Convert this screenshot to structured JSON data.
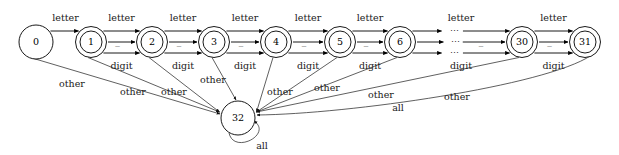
{
  "diagram": {
    "type": "state-transition-diagram",
    "width": 619,
    "height": 155,
    "background_color": "#ffffff",
    "stroke_color": "#000000",
    "text_color": "#1a1a1a"
  },
  "states": [
    {
      "id": "s0",
      "label": "0",
      "cx": 36,
      "cy": 42,
      "r": 17,
      "accepting": false,
      "kind": "start"
    },
    {
      "id": "s1",
      "label": "1",
      "cx": 91,
      "cy": 42,
      "r": 15.5,
      "accepting": true,
      "kind": "normal"
    },
    {
      "id": "s2",
      "label": "2",
      "cx": 152,
      "cy": 42,
      "r": 15.5,
      "accepting": true,
      "kind": "normal"
    },
    {
      "id": "s3",
      "label": "3",
      "cx": 214,
      "cy": 42,
      "r": 15.5,
      "accepting": true,
      "kind": "normal"
    },
    {
      "id": "s4",
      "label": "4",
      "cx": 276,
      "cy": 42,
      "r": 15.5,
      "accepting": true,
      "kind": "normal"
    },
    {
      "id": "s5",
      "label": "5",
      "cx": 340,
      "cy": 42,
      "r": 15.5,
      "accepting": true,
      "kind": "normal"
    },
    {
      "id": "s6",
      "label": "6",
      "cx": 400,
      "cy": 42,
      "r": 15.5,
      "accepting": true,
      "kind": "normal"
    },
    {
      "id": "s30",
      "label": "30",
      "cx": 522,
      "cy": 42,
      "r": 15.5,
      "accepting": true,
      "kind": "normal"
    },
    {
      "id": "s31",
      "label": "31",
      "cx": 585,
      "cy": 42,
      "r": 15.5,
      "accepting": true,
      "kind": "normal"
    },
    {
      "id": "s32",
      "label": "32",
      "cx": 238,
      "cy": 118,
      "r": 17,
      "accepting": false,
      "kind": "error"
    }
  ],
  "labels": {
    "letter": "letter",
    "digit": "digit",
    "underscore": "_",
    "other": "other",
    "all": "all",
    "ellipsis": "⋯"
  },
  "chain_transitions": [
    {
      "from": "s0",
      "to": "s1",
      "symbols": [
        "letter"
      ]
    },
    {
      "from": "s1",
      "to": "s2",
      "symbols": [
        "letter",
        "_",
        "digit"
      ]
    },
    {
      "from": "s2",
      "to": "s3",
      "symbols": [
        "letter",
        "_",
        "digit"
      ]
    },
    {
      "from": "s3",
      "to": "s4",
      "symbols": [
        "letter",
        "_",
        "digit"
      ]
    },
    {
      "from": "s4",
      "to": "s5",
      "symbols": [
        "letter",
        "_",
        "digit"
      ]
    },
    {
      "from": "s5",
      "to": "s6",
      "symbols": [
        "letter",
        "_",
        "digit"
      ]
    },
    {
      "from": "s6",
      "to": "s30",
      "symbols": [
        "letter",
        "_",
        "digit"
      ],
      "elided": true
    },
    {
      "from": "s30",
      "to": "s31",
      "symbols": [
        "letter",
        "_",
        "digit"
      ]
    }
  ],
  "error_transitions": [
    {
      "from": "s0",
      "symbol": "other"
    },
    {
      "from": "s1",
      "symbol": "other"
    },
    {
      "from": "s2",
      "symbol": "other"
    },
    {
      "from": "s3",
      "symbol": "other"
    },
    {
      "from": "s4",
      "symbol": "other"
    },
    {
      "from": "s5",
      "symbol": "other"
    },
    {
      "from": "s6",
      "symbol": "other"
    },
    {
      "from": "s30",
      "symbol": "other"
    },
    {
      "from": "s31",
      "symbol": "all"
    }
  ],
  "self_loops": [
    {
      "on": "s32",
      "symbol": "all"
    }
  ],
  "edge_label_positions": {
    "letter_row_y": 18,
    "digit_row_y": 66,
    "underscore_row_y": 42
  }
}
